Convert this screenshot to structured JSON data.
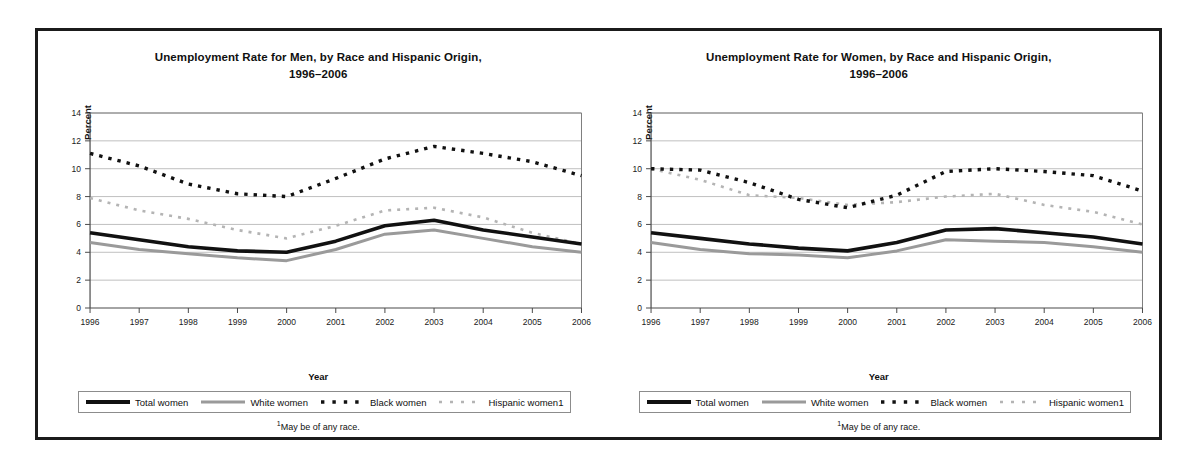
{
  "figure": {
    "footnote_marker": "1",
    "footnote_text": "May be of any race."
  },
  "panels": [
    {
      "id": "men",
      "title_line1": "Unemployment Rate for Men, by Race and Hispanic Origin,",
      "title_line2": "1996–2006",
      "legend": [
        {
          "label": "Total women",
          "style": "thick-solid-black",
          "color": "#111111"
        },
        {
          "label": "White women",
          "style": "thin-solid-gray",
          "color": "#9a9a9a"
        },
        {
          "label": "Black women",
          "style": "dashed-black",
          "color": "#111111"
        },
        {
          "label": "Hispanic women1",
          "style": "dashed-light-gray",
          "color": "#b4b4b4"
        }
      ],
      "chart_data": {
        "type": "line",
        "title": "Unemployment Rate for Men, by Race and Hispanic Origin, 1996–2006",
        "xlabel": "Year",
        "ylabel": "Percent",
        "x": [
          1996,
          1997,
          1998,
          1999,
          2000,
          2001,
          2002,
          2003,
          2004,
          2005,
          2006
        ],
        "xlim": [
          1996,
          2006
        ],
        "ylim": [
          0,
          14
        ],
        "yticks": [
          0,
          2,
          4,
          6,
          8,
          10,
          12,
          14
        ],
        "xticks": [
          "1996",
          "1997",
          "1998",
          "1999",
          "2000",
          "2001",
          "2002",
          "2003",
          "2004",
          "2005",
          "2006"
        ],
        "grid": "horizontal",
        "legend_position": "below",
        "series": [
          {
            "name": "Total women",
            "values": [
              5.4,
              4.9,
              4.4,
              4.1,
              4.0,
              4.8,
              5.9,
              6.3,
              5.6,
              5.1,
              4.6
            ]
          },
          {
            "name": "White women",
            "values": [
              4.7,
              4.2,
              3.9,
              3.6,
              3.4,
              4.2,
              5.3,
              5.6,
              5.0,
              4.4,
              4.0
            ]
          },
          {
            "name": "Black women",
            "values": [
              11.1,
              10.2,
              8.9,
              8.2,
              8.0,
              9.3,
              10.7,
              11.6,
              11.1,
              10.5,
              9.5
            ]
          },
          {
            "name": "Hispanic women1",
            "values": [
              7.9,
              7.0,
              6.4,
              5.6,
              5.0,
              5.9,
              7.0,
              7.2,
              6.5,
              5.4,
              4.6
            ]
          }
        ]
      }
    },
    {
      "id": "women",
      "title_line1": "Unemployment Rate for Women, by Race and Hispanic Origin,",
      "title_line2": "1996–2006",
      "legend": [
        {
          "label": "Total women",
          "style": "thick-solid-black",
          "color": "#111111"
        },
        {
          "label": "White women",
          "style": "thin-solid-gray",
          "color": "#9a9a9a"
        },
        {
          "label": "Black women",
          "style": "dashed-black",
          "color": "#111111"
        },
        {
          "label": "Hispanic women1",
          "style": "dashed-light-gray",
          "color": "#b4b4b4"
        }
      ],
      "chart_data": {
        "type": "line",
        "title": "Unemployment Rate for Women, by Race and Hispanic Origin, 1996–2006",
        "xlabel": "Year",
        "ylabel": "Percent",
        "x": [
          1996,
          1997,
          1998,
          1999,
          2000,
          2001,
          2002,
          2003,
          2004,
          2005,
          2006
        ],
        "xlim": [
          1996,
          2006
        ],
        "ylim": [
          0,
          14
        ],
        "yticks": [
          0,
          2,
          4,
          6,
          8,
          10,
          12,
          14
        ],
        "xticks": [
          "1996",
          "1997",
          "1998",
          "1999",
          "2000",
          "2001",
          "2002",
          "2003",
          "2004",
          "2005",
          "2006"
        ],
        "grid": "horizontal",
        "legend_position": "below",
        "series": [
          {
            "name": "Total women",
            "values": [
              5.4,
              5.0,
              4.6,
              4.3,
              4.1,
              4.7,
              5.6,
              5.7,
              5.4,
              5.1,
              4.6
            ]
          },
          {
            "name": "White women",
            "values": [
              4.7,
              4.2,
              3.9,
              3.8,
              3.6,
              4.1,
              4.9,
              4.8,
              4.7,
              4.4,
              4.0
            ]
          },
          {
            "name": "Black women",
            "values": [
              10.0,
              9.9,
              9.0,
              7.8,
              7.2,
              8.1,
              9.8,
              10.0,
              9.8,
              9.5,
              8.4
            ]
          },
          {
            "name": "Hispanic women1",
            "values": [
              10.0,
              9.2,
              8.1,
              7.9,
              7.4,
              7.6,
              8.0,
              8.2,
              7.4,
              6.9,
              6.0
            ]
          }
        ]
      }
    }
  ]
}
